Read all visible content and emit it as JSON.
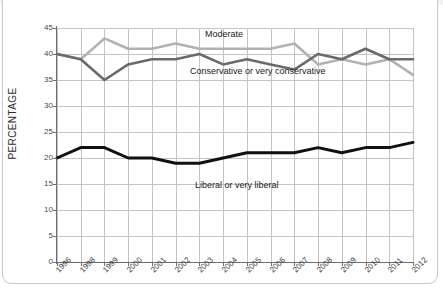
{
  "chart_data": {
    "type": "line",
    "title": "",
    "subtitle": "",
    "xlabel": "",
    "ylabel": "PERCENTAGE",
    "categories": [
      "1996",
      "1998",
      "1999",
      "2000",
      "2001",
      "2002",
      "2003",
      "2004",
      "2005",
      "2006",
      "2007",
      "2008",
      "2009",
      "2010",
      "2011",
      "2012"
    ],
    "ylim": [
      0,
      45
    ],
    "yticks": [
      0,
      5,
      10,
      15,
      20,
      25,
      30,
      35,
      40,
      45
    ],
    "grid": true,
    "legend_position": "inline-annotations",
    "series": [
      {
        "name": "Moderate",
        "color": "#b2b2b2",
        "values": [
          40,
          39,
          43,
          41,
          41,
          42,
          41,
          41,
          41,
          41,
          42,
          38,
          39,
          38,
          39,
          36
        ]
      },
      {
        "name": "Conservative or very conservative",
        "color": "#6a6a6a",
        "values": [
          40,
          39,
          35,
          38,
          39,
          39,
          40,
          38,
          39,
          38,
          37,
          40,
          39,
          41,
          39,
          39
        ]
      },
      {
        "name": "Liberal or very liberal",
        "color": "#111111",
        "values": [
          20,
          22,
          22,
          20,
          20,
          19,
          19,
          20,
          21,
          21,
          21,
          22,
          21,
          22,
          22,
          23
        ]
      }
    ],
    "annotations": [
      {
        "text": "Moderate",
        "series": "Moderate"
      },
      {
        "text": "Conservative or very conservative",
        "series": "Conservative or very conservative"
      },
      {
        "text": "Liberal or very liberal",
        "series": "Liberal or very liberal"
      }
    ]
  },
  "colors": {
    "moderate": "#b2b2b2",
    "conservative": "#6a6a6a",
    "liberal": "#111111",
    "grid": "#c4c4c4",
    "axis": "#6e6e6e",
    "background": "#ffffff"
  }
}
